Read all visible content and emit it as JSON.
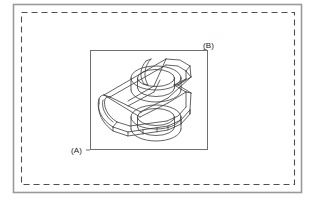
{
  "figure": {
    "type": "patent-technical-drawing",
    "background_color": "#ffffff",
    "line_color": "#3c3c3c",
    "outer_frame": {
      "name": "outer-solid-border",
      "style": "solid",
      "x": 13,
      "y": 4,
      "width": 289,
      "height": 189,
      "stroke": "#9a9a9a",
      "stroke_width": 1.6
    },
    "dashed_frame": {
      "name": "inner-dashed-border",
      "style": "dashed",
      "x": 21,
      "y": 12,
      "width": 274,
      "height": 173,
      "stroke": "#555555",
      "stroke_width": 1.1,
      "dash_pattern": "6 4"
    },
    "detail_box": {
      "name": "detail-region-box",
      "style": "solid",
      "x": 90,
      "y": 50,
      "width": 118,
      "height": 100,
      "stroke": "#6f6f6f",
      "stroke_width": 1.0
    },
    "labels": [
      {
        "id": "a",
        "text": "(A)",
        "x": 71,
        "y": 146
      },
      {
        "id": "b",
        "text": "(B)",
        "x": 203,
        "y": 41
      }
    ],
    "part": {
      "name": "isometric-wireframe-bracket",
      "description": "Isometric wireframe of a mechanical bracket with two cylindrical bosses, a rounded left end and a chamfered rectangular body.",
      "bosses": 2,
      "stroke": "#3c3c3c",
      "stroke_width": 0.75
    }
  }
}
